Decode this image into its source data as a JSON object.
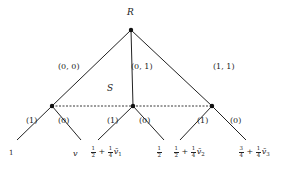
{
  "diagram": {
    "type": "game-tree",
    "root": {
      "label": "R",
      "x": 131,
      "y": 30
    },
    "info_set_label": "S",
    "branches": [
      {
        "label": "(0, 0)",
        "to": "n1"
      },
      {
        "label": "(0, 1)",
        "to": "n2"
      },
      {
        "label": "(1, 1)",
        "to": "n3"
      }
    ],
    "nodes": [
      {
        "id": "n1",
        "x": 52,
        "y": 106
      },
      {
        "id": "n2",
        "x": 133,
        "y": 106
      },
      {
        "id": "n3",
        "x": 212,
        "y": 106
      }
    ],
    "action_labels": {
      "left": "(1)",
      "right": "(0)"
    },
    "leaves": [
      {
        "parent": "n1",
        "action": "(1)",
        "payoff": "1"
      },
      {
        "parent": "n1",
        "action": "(0)",
        "payoff": "v"
      },
      {
        "parent": "n2",
        "action": "(1)",
        "payoff": "1/2 + 1/4 v̄1",
        "parts": {
          "a_num": "1",
          "a_den": "2",
          "plus": "+",
          "b_num": "1",
          "b_den": "4",
          "var": "v̄",
          "sub": "1"
        }
      },
      {
        "parent": "n2",
        "action": "(0)",
        "payoff": "1/2",
        "parts": {
          "a_num": "1",
          "a_den": "2"
        }
      },
      {
        "parent": "n3",
        "action": "(1)",
        "payoff": "1/2 + 1/4 v̄2",
        "parts": {
          "a_num": "1",
          "a_den": "2",
          "plus": "+",
          "b_num": "1",
          "b_den": "4",
          "var": "v̄",
          "sub": "2"
        }
      },
      {
        "parent": "n3",
        "action": "(0)",
        "payoff": "3/4 + 1/4 v̄3",
        "parts": {
          "a_num": "3",
          "a_den": "4",
          "plus": "+",
          "b_num": "1",
          "b_den": "4",
          "var": "v̄",
          "sub": "3"
        }
      }
    ]
  }
}
